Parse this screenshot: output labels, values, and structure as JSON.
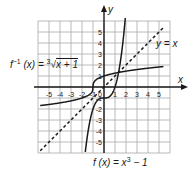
{
  "chart_data": {
    "type": "line",
    "title": "",
    "xlabel": "x",
    "ylabel": "y",
    "xlim": [
      -6,
      6
    ],
    "ylim": [
      -6,
      6
    ],
    "grid": true,
    "x_ticks": [
      -5,
      -4,
      -3,
      -2,
      -1,
      1,
      2,
      3,
      4,
      5
    ],
    "y_ticks": [
      -5,
      -4,
      -3,
      -2,
      -1,
      1,
      2,
      3,
      4,
      5
    ],
    "x_tick_labels": [
      "-5",
      "-4",
      "-3",
      "-2",
      "-1",
      "1",
      "2",
      "3",
      "4",
      "5"
    ],
    "y_tick_labels": [
      "-5",
      "-4",
      "-3",
      "-2",
      "-1",
      "1",
      "2",
      "3",
      "4",
      "5"
    ],
    "origin_label": "0",
    "series": [
      {
        "name": "f(x) = x^3 - 1",
        "style": "solid",
        "expression": "x^3 - 1"
      },
      {
        "name": "f^-1(x) = cbrt(x + 1)",
        "style": "solid",
        "expression": "cbrt(x + 1)"
      },
      {
        "name": "y = x",
        "style": "dashed",
        "expression": "x"
      }
    ],
    "annotations": [
      {
        "text": "f^-1(x) = 3√(x + 1)",
        "position": "upper-left"
      },
      {
        "text": "y = x",
        "position": "upper-right"
      },
      {
        "text": "f(x) = x^3 - 1",
        "position": "bottom"
      }
    ]
  },
  "labels": {
    "inverse_f": "f",
    "inverse_sup": "−1",
    "inverse_rest": " (x) = ",
    "cube_index": "3",
    "radicand": "x + 1",
    "identity": "y = x",
    "func_f": "f (x) = x",
    "func_sup": "3",
    "func_rest": " − 1",
    "x_axis": "x",
    "y_axis": "y"
  },
  "colors": {
    "grid": "#a8a8a8",
    "axis": "#1a1a1a",
    "curve": "#1a1a1a",
    "background": "#ffffff"
  }
}
